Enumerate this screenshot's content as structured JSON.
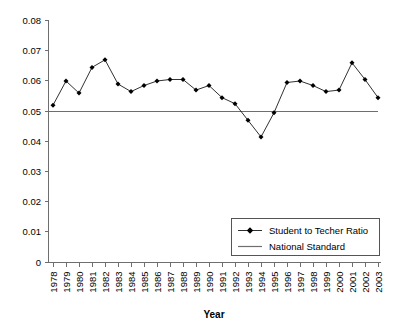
{
  "chart_data": {
    "type": "line",
    "title": "",
    "xlabel": "Year",
    "ylabel": "",
    "xlim": [
      1978,
      2003
    ],
    "ylim": [
      0,
      0.08
    ],
    "grid": false,
    "legend_position": "bottom-right",
    "ytick_labels": [
      "0.08",
      "0.07",
      "0.06",
      "0.05",
      "0.04",
      "0.03",
      "0.02",
      "0.01",
      "0"
    ],
    "ytick_values": [
      0.08,
      0.07,
      0.06,
      0.05,
      0.04,
      0.03,
      0.02,
      0.01,
      0
    ],
    "categories": [
      "1978",
      "1979",
      "1980",
      "1981",
      "1982",
      "1983",
      "1984",
      "1985",
      "1986",
      "1987",
      "1988",
      "1989",
      "1990",
      "1991",
      "1992",
      "1993",
      "1994",
      "1995",
      "1996",
      "1997",
      "1998",
      "1999",
      "2000",
      "2001",
      "2002",
      "2003"
    ],
    "series": [
      {
        "name": "Student to Techer Ratio",
        "marker": "diamond",
        "color": "#000000",
        "values": [
          0.052,
          0.06,
          0.056,
          0.0645,
          0.067,
          0.059,
          0.0565,
          0.0585,
          0.06,
          0.0605,
          0.0605,
          0.057,
          0.0585,
          0.0545,
          0.0525,
          0.047,
          0.0415,
          0.0495,
          0.0595,
          0.06,
          0.0585,
          0.0565,
          0.057,
          0.066,
          0.0605,
          0.0545
        ]
      },
      {
        "name": "National Standard",
        "marker": "none",
        "color": "#6e6e6e",
        "constant_value": 0.05
      }
    ],
    "annotations": []
  },
  "legend": {
    "entries": [
      {
        "label": "Student to Techer Ratio",
        "symbol": "line-with-diamond-marker"
      },
      {
        "label": "National Standard",
        "symbol": "plain-line"
      }
    ]
  },
  "axis": {
    "x_title": "Year"
  }
}
